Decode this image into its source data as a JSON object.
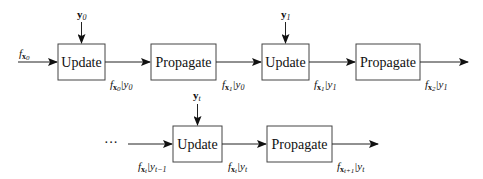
{
  "diagram": {
    "row1": {
      "input_label": {
        "f": "f",
        "sub": "x",
        "subsub": "0"
      },
      "blocks": [
        {
          "label": "Update",
          "observation": {
            "main": "y",
            "sub": "0"
          }
        },
        {
          "label": "Propagate"
        },
        {
          "label": "Update",
          "observation": {
            "main": "y",
            "sub": "1"
          }
        },
        {
          "label": "Propagate"
        }
      ],
      "edge_labels": [
        {
          "f": "f",
          "x_sub": "0",
          "cond": "y",
          "cond_sub": "0"
        },
        {
          "f": "f",
          "x_sub": "1",
          "cond": "y",
          "cond_sub": "0"
        },
        {
          "f": "f",
          "x_sub": "1",
          "cond": "y",
          "cond_sub": "1"
        },
        {
          "f": "f",
          "x_sub": "2",
          "cond": "y",
          "cond_sub": "1"
        }
      ]
    },
    "row2": {
      "ellipsis": "···",
      "blocks": [
        {
          "label": "Update",
          "observation": {
            "main": "y",
            "sub": "t"
          }
        },
        {
          "label": "Propagate"
        }
      ],
      "edge_labels": [
        {
          "f": "f",
          "x_sub": "t",
          "cond": "y",
          "cond_sub": "t−1"
        },
        {
          "f": "f",
          "x_sub": "t",
          "cond": "y",
          "cond_sub": "t"
        },
        {
          "f": "f",
          "x_sub": "t+1",
          "cond": "y",
          "cond_sub": "t"
        }
      ]
    }
  }
}
